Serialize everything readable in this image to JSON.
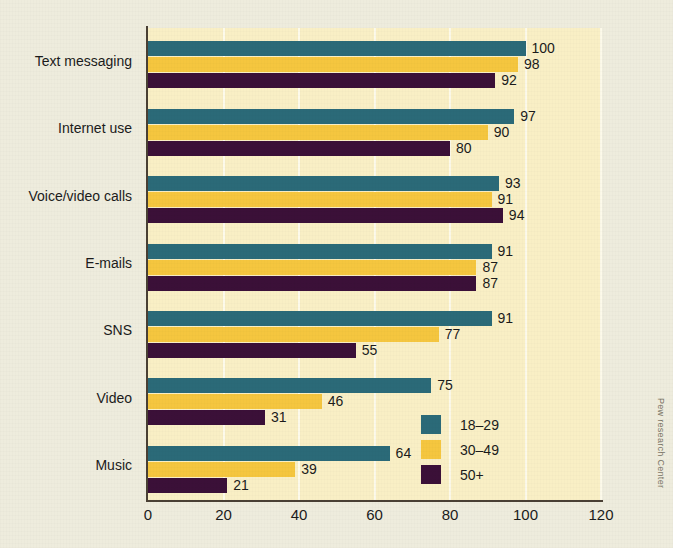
{
  "attribution": "Pew research Center",
  "legend": {
    "position": "inside-bottom-right",
    "entries": [
      {
        "label": "18–29",
        "color": "#2b6a78"
      },
      {
        "label": "30–49",
        "color": "#f5c63f"
      },
      {
        "label": "50+",
        "color": "#3b1038"
      }
    ]
  },
  "colors": {
    "page_background": "#eeecdd",
    "plot_background": "#f9efc5",
    "gridline": "#fdfaea",
    "axis": "#4a4034",
    "series_18_29": "#2b6a78",
    "series_30_49": "#f5c63f",
    "series_50_plus": "#3b1038",
    "text": "#1b1b1b"
  },
  "chart_data": {
    "type": "bar",
    "orientation": "horizontal",
    "title": "",
    "subtitle": "",
    "xlabel": "",
    "ylabel": "",
    "xlim": [
      0,
      120
    ],
    "xticks": [
      0,
      20,
      40,
      60,
      80,
      100,
      120
    ],
    "xtick_labels": [
      "0",
      "20",
      "40",
      "60",
      "80",
      "100",
      "120"
    ],
    "grid": "vertical",
    "legend_position": "inside-bottom-right",
    "categories": [
      "Text messaging",
      "Internet use",
      "Voice/video calls",
      "E-mails",
      "SNS",
      "Video",
      "Music"
    ],
    "series": [
      {
        "name": "18–29",
        "color": "#2b6a78",
        "values": [
          100,
          97,
          93,
          91,
          91,
          75,
          64
        ]
      },
      {
        "name": "30–49",
        "color": "#f5c63f",
        "values": [
          98,
          90,
          91,
          87,
          77,
          46,
          39
        ]
      },
      {
        "name": "50+",
        "color": "#3b1038",
        "values": [
          92,
          80,
          94,
          87,
          55,
          31,
          21
        ]
      }
    ],
    "data_labels": [
      {
        "category": "Text messaging",
        "18–29": 100,
        "30–49": 98,
        "50+": 92
      },
      {
        "category": "Internet use",
        "18–29": 97,
        "30–49": 90,
        "50+": 80
      },
      {
        "category": "Voice/video calls",
        "18–29": 93,
        "30–49": 91,
        "50+": 94
      },
      {
        "category": "E-mails",
        "18–29": 91,
        "30–49": 87,
        "50+": 87
      },
      {
        "category": "SNS",
        "18–29": 91,
        "30–49": 77,
        "50+": 55
      },
      {
        "category": "Video",
        "18–29": 75,
        "30–49": 46,
        "50+": 31
      },
      {
        "category": "Music",
        "18–29": 64,
        "30–49": 39,
        "50+": 21
      }
    ]
  }
}
